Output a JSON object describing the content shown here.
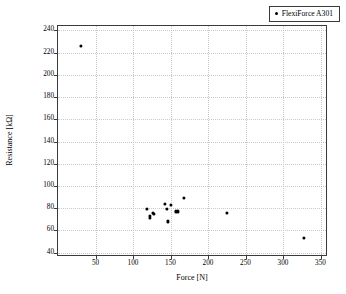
{
  "chart_data": {
    "type": "scatter",
    "title": "",
    "xlabel": "Force [N]",
    "ylabel": "Resistance [kΩ]",
    "xlim": [
      0,
      360
    ],
    "ylim": [
      36,
      244
    ],
    "xticks": [
      50,
      100,
      150,
      200,
      250,
      300,
      350
    ],
    "yticks": [
      40,
      60,
      80,
      100,
      120,
      140,
      160,
      180,
      200,
      220,
      240
    ],
    "grid": true,
    "legend_position": "top-right",
    "series": [
      {
        "name": "FlexiForce A301",
        "marker": "dot",
        "color": "#000000",
        "points": [
          {
            "x": 31,
            "y": 226
          },
          {
            "x": 118,
            "y": 79
          },
          {
            "x": 122,
            "y": 73
          },
          {
            "x": 123,
            "y": 71
          },
          {
            "x": 127,
            "y": 76
          },
          {
            "x": 128,
            "y": 75
          },
          {
            "x": 143,
            "y": 84
          },
          {
            "x": 145,
            "y": 79
          },
          {
            "x": 147,
            "y": 68
          },
          {
            "x": 150,
            "y": 83
          },
          {
            "x": 157,
            "y": 77
          },
          {
            "x": 160,
            "y": 77
          },
          {
            "x": 168,
            "y": 89
          },
          {
            "x": 225,
            "y": 76
          },
          {
            "x": 328,
            "y": 53
          }
        ]
      }
    ]
  },
  "legend": {
    "entries": [
      {
        "label": "FlexiForce A301"
      }
    ]
  },
  "axes": {
    "x_title": "Force [N]",
    "y_title": "Resistance [kΩ]"
  },
  "colors": {
    "marker": "#000000",
    "grid": "#c9c9c9",
    "frame": "#3a3a3a",
    "background": "#ffffff"
  }
}
